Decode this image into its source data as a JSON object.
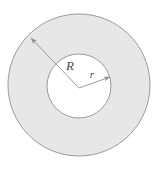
{
  "figure": {
    "name": "annulus-diagram",
    "background_color": "#ffffff",
    "ring_fill_color": "#e7e7e7",
    "inner_fill_color": "#ffffff",
    "stroke_color": "#9a9a9a",
    "label_color": "#4a4a4a",
    "outer_circle": {
      "cx": 79,
      "cy": 85,
      "r": 71
    },
    "inner_circle": {
      "cx": 79,
      "cy": 86,
      "r": 32
    },
    "center_point": {
      "x": 79,
      "y": 88
    },
    "radii": [
      {
        "id": "outer-radius",
        "label": "R",
        "label_x": 70,
        "label_y": 70,
        "label_size": 13,
        "from_x": 79,
        "from_y": 88,
        "to_x": 31,
        "to_y": 38
      },
      {
        "id": "inner-radius",
        "label": "r",
        "label_x": 92,
        "label_y": 78,
        "label_size": 11,
        "from_x": 79,
        "from_y": 88,
        "to_x": 110,
        "to_y": 77
      }
    ]
  }
}
